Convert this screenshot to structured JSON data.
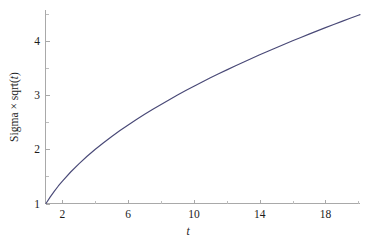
{
  "figure": {
    "background_color": "#ffffff",
    "width": 365,
    "height": 242
  },
  "chart_data": {
    "type": "line",
    "title": "",
    "subtitle": "",
    "xlabel": "t",
    "ylabel": "Sigma × sqrt(t)",
    "xlim": [
      1,
      20.1
    ],
    "ylim": [
      1,
      4.55
    ],
    "grid": false,
    "legend": false,
    "legend_position": "none",
    "series_color": "#494977",
    "axis_color": "#a9a9a9",
    "x_ticks_major": [
      2,
      6,
      10,
      14,
      18
    ],
    "x_ticklabels": [
      "2",
      "6",
      "10",
      "14",
      "18"
    ],
    "x_ticks_minor": [
      4,
      8,
      12,
      16,
      20
    ],
    "y_ticks_major": [
      1,
      2,
      3,
      4
    ],
    "y_ticklabels": [
      "1",
      "2",
      "3",
      "4"
    ],
    "y_ticks_minor": [
      1.5,
      2.5,
      3.5,
      4.5
    ],
    "series": [
      {
        "name": "Sigma × sqrt(t)",
        "color": "#494977",
        "x": [
          1.0,
          1.25,
          1.5,
          1.75,
          2.0,
          2.5,
          3.0,
          3.5,
          4.0,
          4.5,
          5.0,
          5.5,
          6.0,
          6.5,
          7.0,
          7.5,
          8.0,
          8.5,
          9.0,
          9.5,
          10.0,
          10.5,
          11.0,
          11.5,
          12.0,
          12.5,
          13.0,
          13.5,
          14.0,
          14.5,
          15.0,
          15.5,
          16.0,
          16.5,
          17.0,
          17.5,
          18.0,
          18.5,
          19.0,
          19.5,
          20.0,
          20.1
        ],
        "values": [
          1.0,
          1.118,
          1.225,
          1.323,
          1.414,
          1.581,
          1.732,
          1.871,
          2.0,
          2.121,
          2.236,
          2.345,
          2.449,
          2.55,
          2.646,
          2.739,
          2.828,
          2.915,
          3.0,
          3.082,
          3.162,
          3.24,
          3.317,
          3.391,
          3.464,
          3.536,
          3.606,
          3.674,
          3.742,
          3.808,
          3.873,
          3.937,
          4.0,
          4.062,
          4.123,
          4.183,
          4.243,
          4.301,
          4.359,
          4.416,
          4.472,
          4.483
        ]
      }
    ]
  },
  "axis_labels": {
    "x": "t",
    "y_prefix": "Sigma × sqrt(",
    "y_italic": "t",
    "y_suffix": ")"
  }
}
